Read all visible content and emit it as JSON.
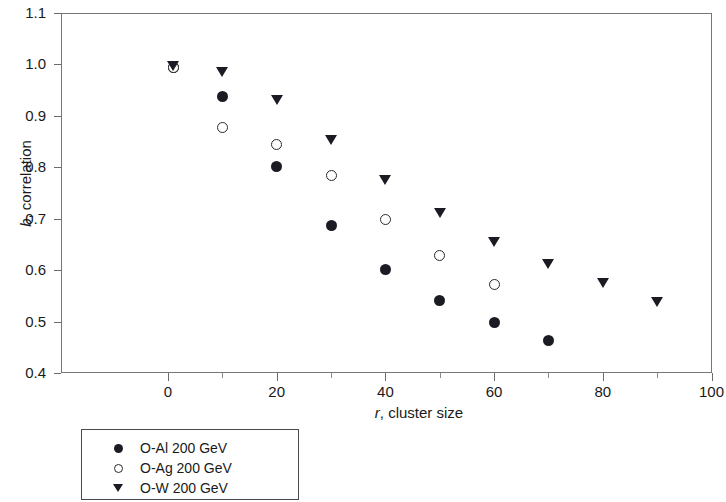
{
  "chart_data": {
    "type": "scatter",
    "title": "",
    "xlabel": "r, cluster size",
    "xlabel_italic": "r",
    "xlabel_rest": ", cluster size",
    "ylabel": "b, correlation",
    "ylabel_italic": "b",
    "ylabel_rest": ", correlation",
    "xlim": [
      -12,
      102
    ],
    "ylim": [
      0.4,
      1.1
    ],
    "grid": false,
    "legend_position": "below-left",
    "x_ticks": [
      0,
      20,
      40,
      60,
      80,
      100
    ],
    "x_tick_labels": [
      "0",
      "20",
      "40",
      "60",
      "80",
      "100"
    ],
    "x_minor_ticks": [
      10,
      30,
      50,
      70,
      90
    ],
    "y_ticks": [
      0.4,
      0.5,
      0.6,
      0.7,
      0.8,
      0.9,
      1.0,
      1.1
    ],
    "y_tick_labels": [
      "0.4",
      "0.5",
      "0.6",
      "0.7",
      "0.8",
      "0.9",
      "1.0",
      "1.1"
    ],
    "series": [
      {
        "name": "O-Al 200 GeV",
        "marker": "filled-circle",
        "color": "#1b1b23",
        "points": [
          {
            "x": 1,
            "y": 0.995
          },
          {
            "x": 10,
            "y": 0.937
          },
          {
            "x": 20,
            "y": 0.801
          },
          {
            "x": 30,
            "y": 0.686
          },
          {
            "x": 40,
            "y": 0.602
          },
          {
            "x": 50,
            "y": 0.541
          },
          {
            "x": 60,
            "y": 0.498
          },
          {
            "x": 70,
            "y": 0.463
          }
        ]
      },
      {
        "name": "O-Ag 200 GeV",
        "marker": "open-circle",
        "color": "#2a2a2a",
        "points": [
          {
            "x": 1,
            "y": 0.995
          },
          {
            "x": 10,
            "y": 0.877
          },
          {
            "x": 20,
            "y": 0.845
          },
          {
            "x": 30,
            "y": 0.784
          },
          {
            "x": 40,
            "y": 0.698
          },
          {
            "x": 50,
            "y": 0.629
          },
          {
            "x": 60,
            "y": 0.572
          }
        ]
      },
      {
        "name": "O-W 200 GeV",
        "marker": "triangle-down",
        "color": "#1b1b23",
        "points": [
          {
            "x": 1,
            "y": 0.997
          },
          {
            "x": 10,
            "y": 0.985
          },
          {
            "x": 20,
            "y": 0.93
          },
          {
            "x": 30,
            "y": 0.853
          },
          {
            "x": 40,
            "y": 0.776
          },
          {
            "x": 50,
            "y": 0.712
          },
          {
            "x": 60,
            "y": 0.655
          },
          {
            "x": 70,
            "y": 0.612
          },
          {
            "x": 80,
            "y": 0.575
          },
          {
            "x": 90,
            "y": 0.539
          }
        ]
      }
    ]
  },
  "legend": {
    "entries": [
      {
        "label": "O-Al 200 GeV",
        "marker": "filled-circle"
      },
      {
        "label": "O-Ag 200 GeV",
        "marker": "open-circle"
      },
      {
        "label": "O-W 200 GeV",
        "marker": "triangle-down"
      }
    ]
  }
}
